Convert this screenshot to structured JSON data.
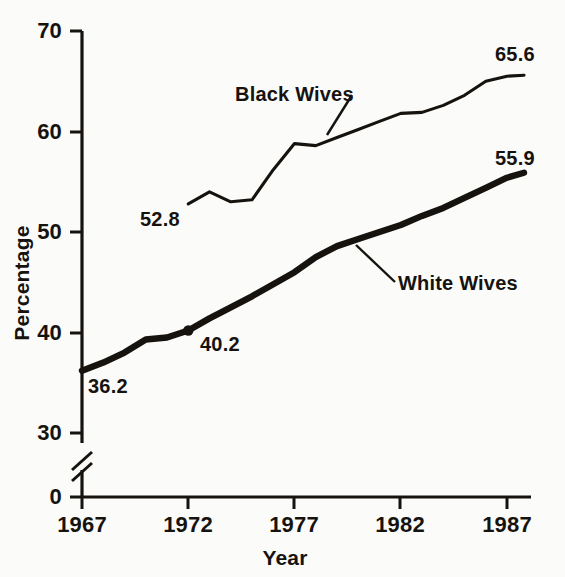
{
  "chart_data": {
    "type": "line",
    "title": "",
    "subtitle": "",
    "xlabel": "Year",
    "ylabel": "Percentage",
    "xlim": [
      1967,
      1988.6
    ],
    "ylim": [
      30,
      70
    ],
    "y_axis_break": true,
    "y_break_labels": [
      "0"
    ],
    "grid": false,
    "legend_position": "inline-annotations",
    "yticks": [
      70,
      60,
      50,
      40,
      30,
      0
    ],
    "ytick_labels": [
      "70",
      "60",
      "50",
      "40",
      "30",
      "0"
    ],
    "xticks": [
      1967,
      1972,
      1977,
      1982,
      1987
    ],
    "xtick_labels": [
      "1967",
      "1972",
      "1977",
      "1982",
      "1987"
    ],
    "series": [
      {
        "name": "Black Wives",
        "label_text": "Black Wives",
        "line_weight": "thin",
        "color": "#16130f",
        "x": [
          1972,
          1973,
          1974,
          1975,
          1976,
          1977,
          1978,
          1979,
          1980,
          1981,
          1982,
          1983,
          1984,
          1985,
          1986,
          1987,
          1987.8
        ],
        "values": [
          52.8,
          54.0,
          53.0,
          53.2,
          56.2,
          58.8,
          58.6,
          59.4,
          60.2,
          61.0,
          61.8,
          61.9,
          62.6,
          63.6,
          65.0,
          65.5,
          65.6
        ],
        "endpoint_label": "65.6",
        "start_label": "52.8"
      },
      {
        "name": "White Wives",
        "label_text": "White Wives",
        "line_weight": "thick",
        "color": "#16130f",
        "x": [
          1967,
          1968,
          1969,
          1970,
          1971,
          1972,
          1973,
          1974,
          1975,
          1976,
          1977,
          1978,
          1979,
          1980,
          1981,
          1982,
          1983,
          1984,
          1985,
          1986,
          1987,
          1987.8
        ],
        "values": [
          36.2,
          37.0,
          38.0,
          39.3,
          39.5,
          40.2,
          41.4,
          42.5,
          43.6,
          44.8,
          46.0,
          47.5,
          48.6,
          49.3,
          50.0,
          50.7,
          51.6,
          52.4,
          53.4,
          54.4,
          55.4,
          55.9
        ],
        "endpoint_label": "55.9",
        "start_label": "36.2",
        "marked_point": {
          "x": 1972,
          "y": 40.2,
          "label": "40.2"
        }
      }
    ],
    "annotations": [
      {
        "text": "36.2",
        "series": "White Wives",
        "kind": "start-value"
      },
      {
        "text": "40.2",
        "series": "White Wives",
        "kind": "marked-value"
      },
      {
        "text": "55.9",
        "series": "White Wives",
        "kind": "end-value"
      },
      {
        "text": "52.8",
        "series": "Black Wives",
        "kind": "start-value"
      },
      {
        "text": "65.6",
        "series": "Black Wives",
        "kind": "end-value"
      }
    ]
  },
  "axis": {
    "y_title": "Percentage",
    "x_title": "Year",
    "ytick_70": "70",
    "ytick_60": "60",
    "ytick_50": "50",
    "ytick_40": "40",
    "ytick_30": "30",
    "ytick_0": "0",
    "xtick_1967": "1967",
    "xtick_1972": "1972",
    "xtick_1977": "1977",
    "xtick_1982": "1982",
    "xtick_1987": "1987"
  },
  "labels": {
    "black_wives": "Black Wives",
    "white_wives": "White Wives",
    "val_36_2": "36.2",
    "val_40_2": "40.2",
    "val_52_8": "52.8",
    "val_55_9": "55.9",
    "val_65_6": "65.6"
  },
  "colors": {
    "ink": "#16130f",
    "paper": "#fbfbfa"
  }
}
